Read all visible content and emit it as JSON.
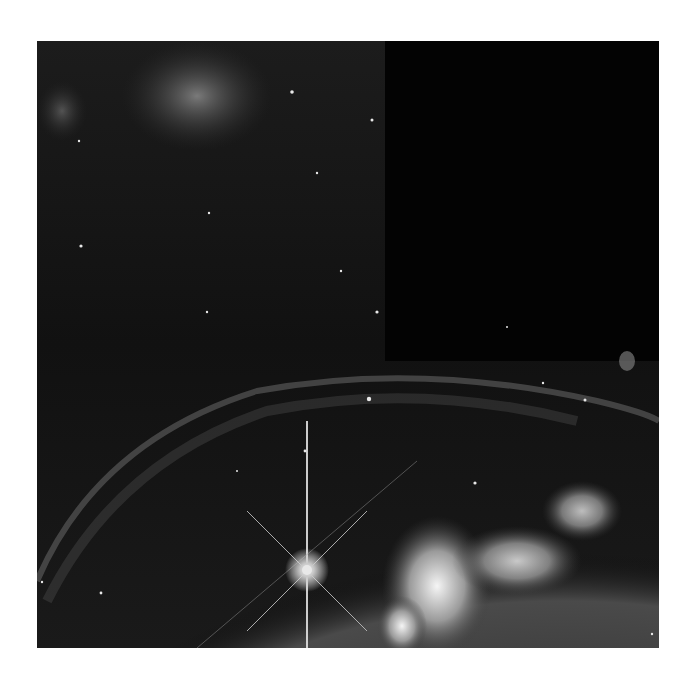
{
  "image": {
    "subject": "Bubble Nebula",
    "description": "Grayscale astronomical photograph of a nebula bubble shell with a bright diffraction-spiked star and glowing gas clouds",
    "colors": {
      "background": "#ffffff",
      "sky": "#0b0b0b",
      "dark_chip": "#030303",
      "nebula": "#9a9a9a",
      "bright_gas": "#f2f2f2",
      "star": "#ffffff"
    },
    "bright_star": {
      "x": 307,
      "y": 570
    }
  }
}
